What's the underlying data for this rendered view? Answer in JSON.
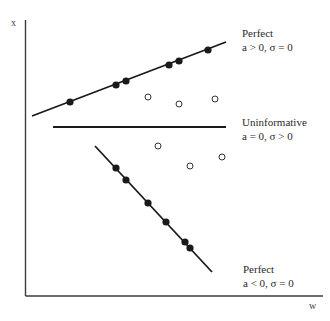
{
  "chart_data": {
    "type": "scatter",
    "title": "",
    "xlabel": "w",
    "ylabel": "x",
    "grid": false,
    "legend": "none (inline annotations)",
    "axes": {
      "origin_px": [
        25.5,
        296
      ],
      "x_end_px": 323,
      "y_top_px": 20,
      "color": "#3c3c3c"
    },
    "series": [
      {
        "name": "Perfect a > 0, σ = 0",
        "marker": "filled-circle",
        "line": {
          "from": [
            32,
            116
          ],
          "to": [
            226,
            42
          ]
        },
        "points": [
          [
            70,
            102
          ],
          [
            116,
            85
          ],
          [
            126,
            81
          ],
          [
            169,
            65
          ],
          [
            179,
            61
          ],
          [
            208,
            50
          ]
        ]
      },
      {
        "name": "Uninformative a = 0, σ > 0",
        "marker": "open-circle",
        "line": {
          "from": [
            53,
            127
          ],
          "to": [
            226,
            127
          ]
        },
        "points": [
          [
            148,
            97
          ],
          [
            179,
            104
          ],
          [
            215,
            99
          ],
          [
            158,
            146
          ],
          [
            190,
            166
          ],
          [
            222,
            157
          ]
        ]
      },
      {
        "name": "Perfect a < 0, σ = 0",
        "marker": "filled-circle",
        "line": {
          "from": [
            95,
            146
          ],
          "to": [
            212,
            272
          ]
        },
        "points": [
          [
            116,
            168
          ],
          [
            126,
            180
          ],
          [
            148,
            203
          ],
          [
            166,
            222
          ],
          [
            185,
            242
          ],
          [
            190,
            248
          ]
        ]
      }
    ],
    "annotations": [
      {
        "lines": [
          "Perfect",
          "a > 0, σ = 0"
        ],
        "pos": [
          242,
          27
        ]
      },
      {
        "lines": [
          "Uninformative",
          "a = 0, σ > 0"
        ],
        "pos": [
          242,
          116
        ]
      },
      {
        "lines": [
          "Perfect",
          "a < 0, σ = 0"
        ],
        "pos": [
          243,
          263
        ]
      }
    ],
    "note": "Coordinates are pixel positions; the axes carry no numeric ticks."
  },
  "labels": {
    "y_axis": "x",
    "x_axis": "w",
    "top_title": "Perfect",
    "top_sub": "a > 0, σ = 0",
    "mid_title": "Uninformative",
    "mid_sub": "a = 0, σ > 0",
    "bottom_title": "Perfect",
    "bottom_sub": "a < 0, σ = 0"
  },
  "colors": {
    "ink": "#1a1a1a",
    "axis": "#3c3c3c",
    "background": "#ffffff"
  }
}
